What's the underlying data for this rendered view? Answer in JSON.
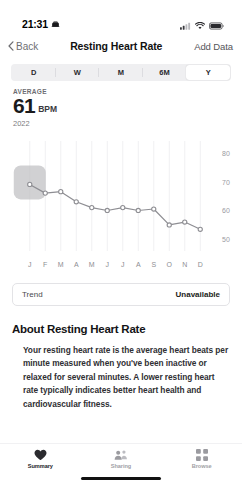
{
  "status_bar": {
    "time": "21:31",
    "alarm_icon": "alarm-icon",
    "cellular_icon": "cellular-signal-icon",
    "wifi_icon": "wifi-icon",
    "battery_icon": "battery-icon"
  },
  "nav": {
    "back_label": "Back",
    "back_icon": "chevron-left-icon",
    "title": "Resting Heart Rate",
    "add_data_label": "Add Data"
  },
  "segmented_control": {
    "options": [
      "D",
      "W",
      "M",
      "6M",
      "Y"
    ],
    "selected": "Y"
  },
  "summary": {
    "label": "AVERAGE",
    "value": "61",
    "unit": "BPM",
    "period": "2022"
  },
  "chart_data": {
    "type": "line",
    "title": "Resting Heart Rate",
    "xlabel": "",
    "ylabel": "BPM",
    "categories": [
      "J",
      "F",
      "M",
      "A",
      "M",
      "J",
      "J",
      "A",
      "S",
      "O",
      "N",
      "D"
    ],
    "month_names": [
      "January",
      "February",
      "March",
      "April",
      "May",
      "June",
      "July",
      "August",
      "September",
      "October",
      "November",
      "December"
    ],
    "values": [
      69,
      66,
      66.5,
      63,
      61,
      60,
      61,
      60,
      60.5,
      55,
      56,
      53.5
    ],
    "ylim": [
      46,
      84
    ],
    "yticks": [
      80,
      70,
      60,
      50
    ],
    "ytick_labels": [
      "80",
      "70",
      "60",
      "50"
    ],
    "grid": "vertical",
    "legend": "none",
    "line_color": "#8e8e93",
    "marker": "open-circle",
    "selection": {
      "category": "J",
      "highlight_color": "#bfbfc2",
      "visible": true
    }
  },
  "trend": {
    "label": "Trend",
    "value": "Unavailable"
  },
  "about": {
    "title": "About Resting Heart Rate",
    "body": "Your resting heart rate is the average heart beats per minute measured when you've been inactive or relaxed for several minutes. A lower resting heart rate typically indicates better heart health and cardiovascular fitness."
  },
  "tab_bar": {
    "tabs": [
      {
        "label": "Summary",
        "icon": "heart-icon",
        "active": true
      },
      {
        "label": "Sharing",
        "icon": "people-icon",
        "active": false
      },
      {
        "label": "Browse",
        "icon": "grid-icon",
        "active": false
      }
    ]
  }
}
